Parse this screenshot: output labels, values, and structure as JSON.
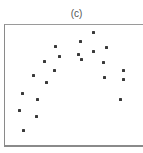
{
  "chart_data": {
    "type": "scatter",
    "title": "(c)",
    "xlabel": "",
    "ylabel": "",
    "grid": false,
    "legend": null,
    "axis_ticks": false,
    "xlim": [
      0,
      1
    ],
    "ylim": [
      0,
      1
    ],
    "note": "No tick labels shown; coordinates normalized to the plot frame (x from left edge, y from bottom edge). Points trace an inverted-U / arch shape.",
    "points": [
      {
        "x": 0.129,
        "y": 0.431
      },
      {
        "x": 0.236,
        "y": 0.39
      },
      {
        "x": 0.114,
        "y": 0.293
      },
      {
        "x": 0.229,
        "y": 0.244
      },
      {
        "x": 0.136,
        "y": 0.138
      },
      {
        "x": 0.371,
        "y": 0.821
      },
      {
        "x": 0.393,
        "y": 0.732
      },
      {
        "x": 0.286,
        "y": 0.699
      },
      {
        "x": 0.364,
        "y": 0.626
      },
      {
        "x": 0.214,
        "y": 0.585
      },
      {
        "x": 0.3,
        "y": 0.528
      },
      {
        "x": 0.636,
        "y": 0.927
      },
      {
        "x": 0.543,
        "y": 0.854
      },
      {
        "x": 0.636,
        "y": 0.78
      },
      {
        "x": 0.729,
        "y": 0.805
      },
      {
        "x": 0.529,
        "y": 0.756
      },
      {
        "x": 0.557,
        "y": 0.715
      },
      {
        "x": 0.714,
        "y": 0.691
      },
      {
        "x": 0.857,
        "y": 0.618
      },
      {
        "x": 0.721,
        "y": 0.569
      },
      {
        "x": 0.85,
        "y": 0.545
      },
      {
        "x": 0.829,
        "y": 0.39
      }
    ],
    "frame": {
      "left_px": 4,
      "top_px": 24,
      "width_px": 140,
      "height_px": 123
    },
    "point_color": "#3a3a3a",
    "frame_color": "#8a8a8a"
  }
}
